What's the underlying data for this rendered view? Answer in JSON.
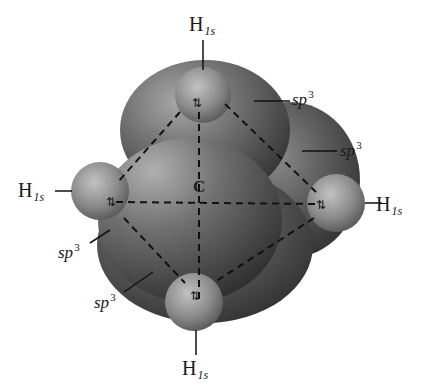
{
  "diagram": {
    "center_atom": "C",
    "hydrogen_labels": [
      {
        "position": "top",
        "element": "H",
        "subscript": "1s"
      },
      {
        "position": "left",
        "element": "H",
        "subscript": "1s"
      },
      {
        "position": "right",
        "element": "H",
        "subscript": "1s"
      },
      {
        "position": "bottom",
        "element": "H",
        "subscript": "1s"
      }
    ],
    "orbital_labels": [
      {
        "position": "upper-right",
        "base": "sp",
        "superscript": "3"
      },
      {
        "position": "right",
        "base": "sp",
        "superscript": "3"
      },
      {
        "position": "left",
        "base": "sp",
        "superscript": "3"
      },
      {
        "position": "lower-left",
        "base": "sp",
        "superscript": "3"
      }
    ],
    "electron_pair_symbol": "⇅",
    "colors": {
      "lobe_dark": "#3a3a3a",
      "lobe_light": "#9a9a9a",
      "sphere_light": "#b5b5b5",
      "sphere_dark": "#4a4a4a",
      "dash": "#111111",
      "text": "#1a1a1a"
    }
  }
}
